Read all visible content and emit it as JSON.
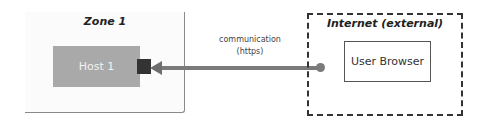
{
  "zone1": {
    "title": "Zone 1",
    "host_label": "Host 1"
  },
  "connection": {
    "label_line1": "communication",
    "label_line2": "(https)"
  },
  "internet": {
    "title": "Internet (external)",
    "client_label": "User Browser"
  },
  "colors": {
    "host_fill": "#a9a9a9",
    "port": "#333333",
    "line": "#7a7a7a",
    "dashed_border": "#333333"
  }
}
